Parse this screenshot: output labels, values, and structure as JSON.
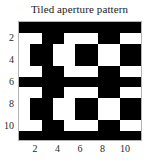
{
  "chart_data": {
    "type": "heatmap",
    "title": "Tiled aperture pattern",
    "xlabel": "",
    "ylabel": "",
    "xlim": [
      0.5,
      11.5
    ],
    "ylim": [
      11.5,
      0.5
    ],
    "grid": false,
    "legend": null,
    "colors": {
      "on": "#000000",
      "off": "#ffffff",
      "axis": "#b4b4b4",
      "text": "#1a1a1a",
      "background": "#ffffff"
    },
    "x_ticks": [
      2,
      4,
      6,
      8,
      10
    ],
    "y_ticks": [
      2,
      4,
      6,
      8,
      10
    ],
    "x_tick_labels": [
      "2",
      "4",
      "6",
      "8",
      "10"
    ],
    "y_tick_labels": [
      "2",
      "4",
      "6",
      "8",
      "10"
    ],
    "n_rows": 11,
    "n_cols": 11,
    "value_meaning": {
      "1": "black (opaque)",
      "0": "white (aperture)"
    },
    "matrix": [
      [
        1,
        1,
        1,
        1,
        1,
        1,
        1,
        1,
        1,
        1,
        1
      ],
      [
        0,
        0,
        1,
        1,
        0,
        0,
        0,
        1,
        1,
        0,
        0
      ],
      [
        0,
        1,
        1,
        0,
        0,
        1,
        1,
        0,
        0,
        1,
        1
      ],
      [
        0,
        1,
        1,
        0,
        0,
        1,
        1,
        0,
        0,
        1,
        1
      ],
      [
        0,
        0,
        1,
        1,
        0,
        0,
        0,
        1,
        1,
        0,
        0
      ],
      [
        1,
        1,
        1,
        1,
        1,
        1,
        1,
        1,
        1,
        1,
        1
      ],
      [
        0,
        0,
        1,
        1,
        0,
        0,
        0,
        1,
        1,
        0,
        0
      ],
      [
        0,
        1,
        1,
        0,
        0,
        1,
        1,
        0,
        0,
        1,
        1
      ],
      [
        0,
        1,
        1,
        0,
        0,
        1,
        1,
        0,
        0,
        1,
        1
      ],
      [
        0,
        0,
        1,
        1,
        0,
        0,
        0,
        1,
        1,
        0,
        0
      ],
      [
        1,
        1,
        1,
        1,
        1,
        1,
        1,
        1,
        1,
        1,
        1
      ]
    ]
  },
  "figure": {
    "title": "Tiled aperture pattern"
  }
}
